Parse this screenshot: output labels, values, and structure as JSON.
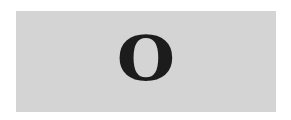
{
  "card": {
    "text": "O",
    "background_color": "#d4d4d4",
    "text_color": "#1c1c1c"
  }
}
